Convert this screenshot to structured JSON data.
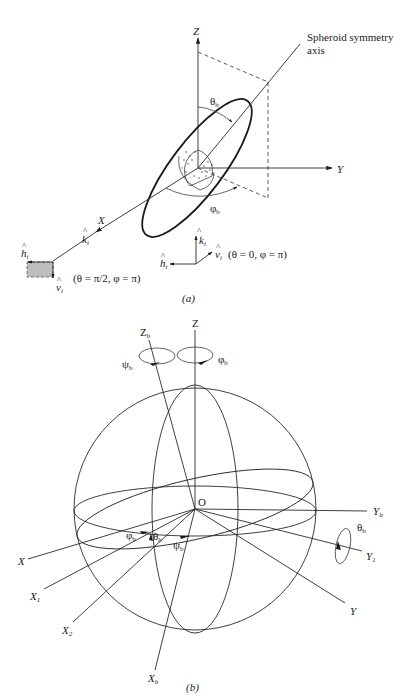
{
  "panel_a": {
    "caption": "(a)",
    "axes": {
      "z": "Z",
      "y": "Y",
      "x": "X"
    },
    "symmetry_axis_label_line1": "Spheroid symmetry",
    "symmetry_axis_label_line2": "axis",
    "theta_b": "θ",
    "phi_b": "φ",
    "sub_b": "b",
    "incidence_horizontal": {
      "k": "k",
      "h": "h",
      "v": "v",
      "sub_i": "i",
      "condition": "(θ = π/2, φ = π)",
      "condition_parts": {
        "open": "(θ",
        "eq1": " = ",
        "pi_over_2": "π/2",
        "comma_phi": ", φ",
        "eq2": " = π)"
      }
    },
    "incidence_vertical": {
      "k": "k",
      "h": "h",
      "v": "v",
      "sub_i": "i",
      "condition": "(θ = 0, φ = π)"
    },
    "colors": {
      "line": "#2a2a2a",
      "polarization_box": "#bdbdbd"
    }
  },
  "panel_b": {
    "caption": "(b)",
    "origin": "O",
    "axes": {
      "z": "Z",
      "zb": "Z",
      "y": "Y",
      "yb": "Y",
      "y1": "Y",
      "x": "X",
      "x1": "X",
      "x2": "X",
      "xb": "X"
    },
    "subscripts": {
      "b": "b",
      "one": "1",
      "two": "2"
    },
    "rotations": {
      "psi_b": "ψ",
      "phi_b": "φ",
      "theta_b": "θ"
    }
  }
}
